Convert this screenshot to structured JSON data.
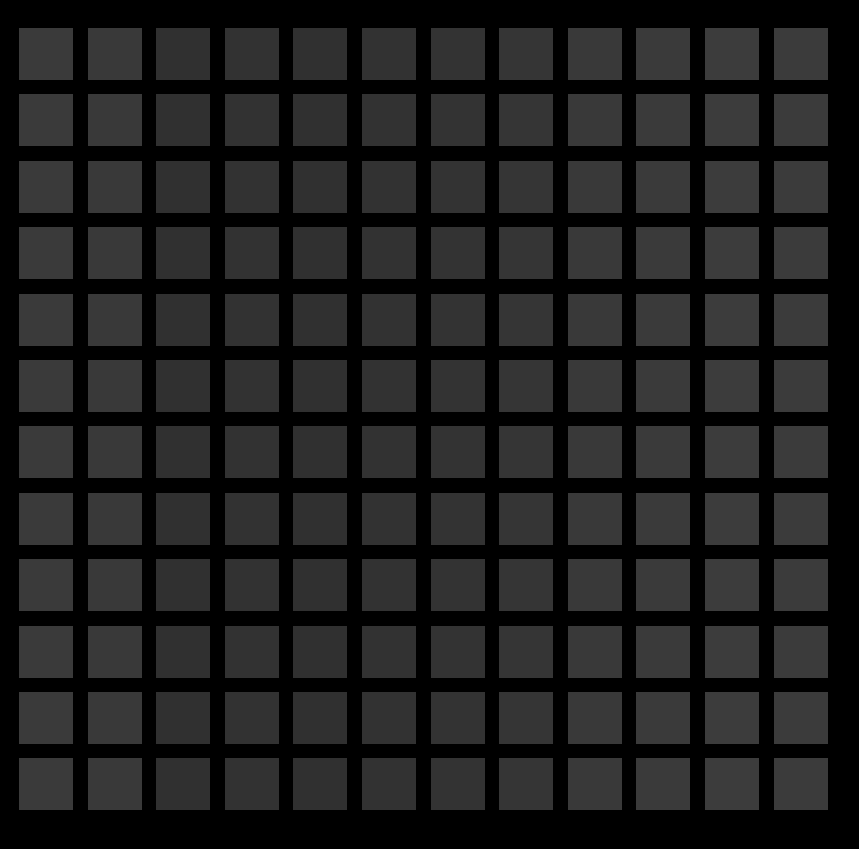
{
  "canvas": {
    "width": 859,
    "height": 849,
    "background": "#000000"
  },
  "grid": {
    "rows": 12,
    "cols": 12,
    "origin_x": 19,
    "origin_y": 28,
    "col_pitch": 68.6,
    "row_pitch": 66.4,
    "cell_width": 54,
    "cell_height": 52,
    "column_colors": [
      "#3a3a3a",
      "#393939",
      "#303030",
      "#323232",
      "#303030",
      "#323232",
      "#333333",
      "#353535",
      "#393939",
      "#3a3a3a",
      "#3c3c3c",
      "#3b3b3b"
    ]
  }
}
